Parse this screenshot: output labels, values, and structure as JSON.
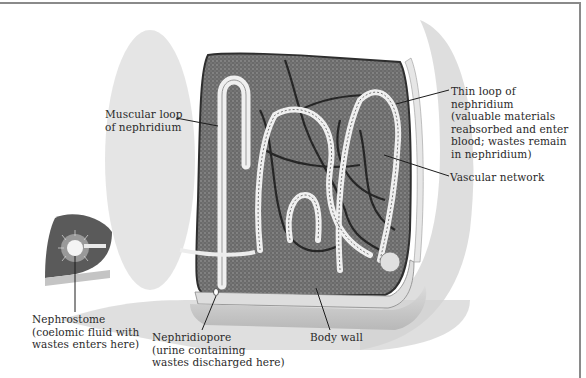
{
  "figure": {
    "colors": {
      "tissue": "#6e6e6e",
      "tissue_dark": "#3a3a3a",
      "body_wall": "#c8c8c8",
      "background_shade": "#d8d8d8",
      "tubule_light": "#f2f2f2",
      "label_text": "#2a2a2a",
      "frame": "#8a8a8a"
    }
  },
  "labels": {
    "muscular_loop": {
      "line1": "Muscular loop",
      "line2": "of nephridium"
    },
    "thin_loop": {
      "line1": "Thin loop of",
      "line2": "nephridium",
      "line3": "(valuable materials",
      "line4": "reabsorbed and enter",
      "line5": "blood; wastes remain",
      "line6": "in nephridium)"
    },
    "vascular_network": {
      "line1": "Vascular network"
    },
    "nephrostome": {
      "line1": "Nephrostome",
      "line2": "(coelomic fluid with",
      "line3": "wastes enters here)"
    },
    "nephridiopore": {
      "line1": "Nephridiopore",
      "line2": "(urine containing",
      "line3": "wastes discharged here)"
    },
    "body_wall": {
      "line1": "Body wall"
    }
  }
}
